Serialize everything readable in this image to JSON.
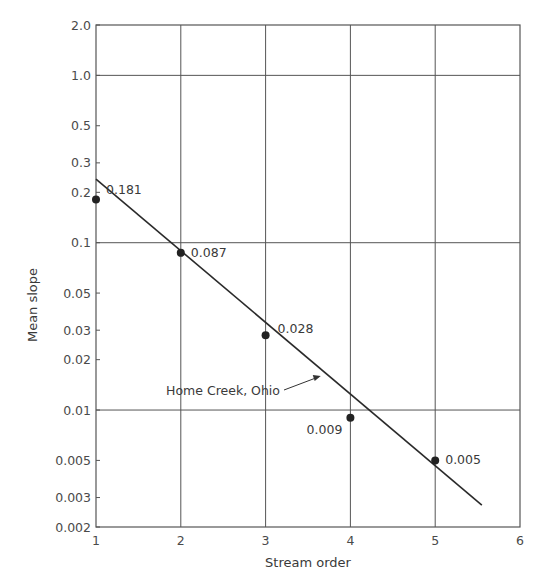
{
  "chart_data": {
    "type": "scatter",
    "title": "",
    "xlabel": "Stream order",
    "ylabel": "Mean slope",
    "xlim": [
      1,
      6
    ],
    "ylim": [
      0.002,
      2.0
    ],
    "yscale": "log",
    "grid": true,
    "x_ticks": [
      "1",
      "2",
      "3",
      "4",
      "5",
      "6"
    ],
    "y_ticks": [
      "2.0",
      "1.0",
      "0.5",
      "0.3",
      "0.2",
      "0.1",
      "0.05",
      "0.03",
      "0.02",
      "0.01",
      "0.005",
      "0.003",
      "0.002"
    ],
    "series": [
      {
        "name": "Home Creek, Ohio",
        "points": [
          {
            "x": 1,
            "y": 0.181,
            "label": "0.181"
          },
          {
            "x": 2,
            "y": 0.087,
            "label": "0.087"
          },
          {
            "x": 3,
            "y": 0.028,
            "label": "0.028"
          },
          {
            "x": 4,
            "y": 0.009,
            "label": "0.009"
          },
          {
            "x": 5,
            "y": 0.005,
            "label": "0.005"
          }
        ]
      }
    ],
    "fit_line": {
      "x_start": 1.0,
      "y_start": 0.24,
      "x_end": 5.55,
      "y_end": 0.0027
    },
    "annotation": {
      "text": "Home Creek, Ohio",
      "arrow_to": {
        "x": 3.65,
        "y": 0.016
      }
    }
  }
}
